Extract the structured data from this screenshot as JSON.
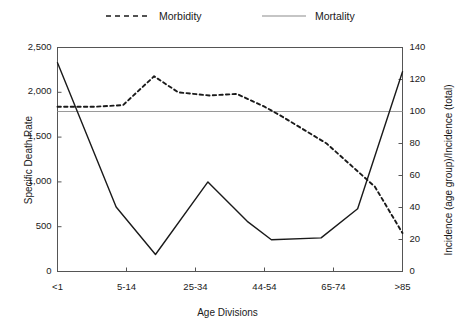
{
  "chart_data": {
    "type": "line",
    "title": "",
    "xlabel": "Age Divisions",
    "ylabel": "Specific Death Rate",
    "ylabel_right": "Incidence (age group)/Incidence (total)",
    "grid": false,
    "legend_position": "top",
    "categories": [
      "<1",
      "5-14",
      "25-34",
      "44-54",
      "65-74",
      ">85"
    ],
    "x_tick_labels": [
      "<1",
      "5-14",
      "25-34",
      "44-54",
      "65-74",
      ">85"
    ],
    "y_left_ticks": [
      "0",
      "500",
      "1,000",
      "1,500",
      "2,000",
      "2,500"
    ],
    "y_left_values": [
      0,
      500,
      1000,
      1500,
      2000,
      2500
    ],
    "y_right_ticks": [
      "0",
      "20",
      "40",
      "60",
      "80",
      "100",
      "120",
      "140"
    ],
    "y_right_values": [
      0,
      20,
      40,
      60,
      80,
      100,
      120,
      140
    ],
    "ylim": [
      0,
      2500
    ],
    "ylim_right": [
      0,
      140
    ],
    "reference_line": {
      "axis": "right",
      "value": 100,
      "color": "#9a9a9a"
    },
    "series": [
      {
        "name": "Morbidity",
        "style": "dashed",
        "color": "#1a1a1a",
        "axis": "right",
        "x": [
          0.0,
          0.55,
          0.95,
          1.4,
          1.75,
          2.2,
          2.6,
          3.0,
          3.25,
          3.9,
          4.6,
          5.0
        ],
        "values": [
          103,
          103,
          104,
          122,
          112,
          110,
          111,
          103,
          97,
          80,
          53,
          24
        ]
      },
      {
        "name": "Mortality",
        "style": "solid",
        "color": "#1a1a1a",
        "axis": "left",
        "x": [
          0.0,
          0.85,
          1.42,
          2.18,
          2.75,
          3.1,
          3.82,
          4.35,
          5.0
        ],
        "values": [
          2330,
          720,
          190,
          1000,
          560,
          355,
          375,
          700,
          2230
        ]
      }
    ]
  },
  "legend": {
    "items": [
      {
        "label": "Morbidity",
        "style": "dashed"
      },
      {
        "label": "Mortality",
        "style": "solid"
      }
    ]
  },
  "axes": {
    "x_title": "Age Divisions",
    "y_left_title": "Specific Death Rate",
    "y_right_title": "Incidence (age group)/Incidence (total)"
  }
}
